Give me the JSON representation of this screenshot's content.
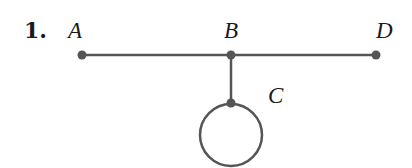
{
  "problem": {
    "number": "1."
  },
  "graph": {
    "vertices": [
      {
        "id": "A",
        "label": "A",
        "x": 82,
        "y": 55
      },
      {
        "id": "B",
        "label": "B",
        "x": 231,
        "y": 55
      },
      {
        "id": "D",
        "label": "D",
        "x": 376,
        "y": 55
      },
      {
        "id": "C",
        "label": "C",
        "x": 231,
        "y": 103
      }
    ],
    "edges": [
      {
        "from": "A",
        "to": "B"
      },
      {
        "from": "B",
        "to": "D"
      },
      {
        "from": "B",
        "to": "C"
      },
      {
        "from": "C",
        "to": "C",
        "type": "loop"
      }
    ],
    "colors": {
      "edge": "#555555",
      "text": "#1a1a1a"
    }
  }
}
